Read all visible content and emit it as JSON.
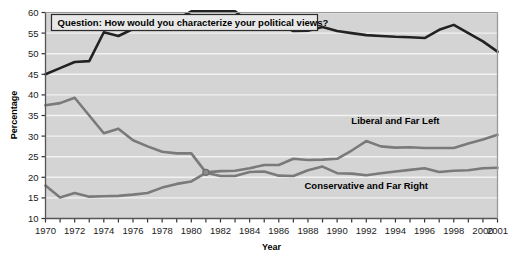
{
  "chart_data": {
    "type": "line",
    "title": "Question: How would you characterize your political views?",
    "xlabel": "Year",
    "ylabel": "Percentage",
    "xlim": [
      1970,
      2001
    ],
    "ylim": [
      10,
      60
    ],
    "ytick_step": 5,
    "grid": "horizontal",
    "legend": "inline-labels",
    "plot_background": "#d4d4d4",
    "x": [
      1970,
      1971,
      1972,
      1973,
      1974,
      1975,
      1976,
      1977,
      1978,
      1979,
      1980,
      1981,
      1982,
      1983,
      1984,
      1985,
      1986,
      1987,
      1988,
      1989,
      1990,
      1991,
      1992,
      1993,
      1994,
      1995,
      1996,
      1997,
      1998,
      1999,
      2000,
      2001
    ],
    "xticks": [
      1970,
      1971,
      1972,
      1973,
      1974,
      1975,
      1976,
      1977,
      1978,
      1979,
      1980,
      1981,
      1982,
      1983,
      1984,
      1985,
      1986,
      1987,
      1988,
      1989,
      1990,
      1991,
      1992,
      1993,
      1994,
      1995,
      1996,
      1997,
      1998,
      1999,
      2000,
      2001
    ],
    "xtick_labels": [
      "1970",
      "",
      "1972",
      "",
      "1974",
      "",
      "1976",
      "",
      "1978",
      "",
      "1980",
      "",
      "1982",
      "",
      "1984",
      "",
      "1986",
      "",
      "1988",
      "",
      "1990",
      "",
      "1992",
      "",
      "1994",
      "",
      "1996",
      "",
      "1998",
      "",
      "2000",
      "2001"
    ],
    "yticks": [
      10,
      15,
      20,
      25,
      30,
      35,
      40,
      45,
      50,
      55,
      60
    ],
    "ytick_labels": [
      "10",
      "15",
      "20",
      "25",
      "30",
      "35",
      "40",
      "45",
      "50",
      "55",
      "60"
    ],
    "series": [
      {
        "name": "Middle of the Road",
        "color": "#222222",
        "width": 2.6,
        "label_x": 1980,
        "label_y": 55.5,
        "values": [
          45.0,
          46.5,
          48.0,
          48.2,
          55.2,
          54.3,
          56.0,
          57.0,
          58.0,
          58.3,
          60.3,
          60.3,
          60.3,
          60.3,
          57.5,
          57.8,
          57.2,
          55.5,
          55.6,
          56.5,
          55.5,
          55.0,
          54.5,
          54.3,
          54.1,
          54.0,
          53.8,
          55.8,
          57.0,
          55.0,
          53.0,
          50.5
        ]
      },
      {
        "name": "Liberal and Far Left",
        "color": "#7a7a7a",
        "width": 2.6,
        "label_x": 1994,
        "label_y": 33.0,
        "values": [
          37.5,
          38.0,
          39.3,
          35.0,
          30.7,
          31.8,
          29.0,
          27.5,
          26.2,
          25.8,
          25.8,
          21.2,
          21.5,
          21.6,
          22.2,
          23.0,
          23.0,
          24.5,
          24.2,
          24.3,
          24.5,
          26.5,
          28.8,
          27.5,
          27.2,
          27.3,
          27.1,
          27.1,
          27.1,
          28.2,
          29.2,
          30.3
        ]
      },
      {
        "name": "Conservative and Far Right",
        "color": "#7a7a7a",
        "width": 2.6,
        "label_x": 1992,
        "label_y": 17.2,
        "values": [
          18.0,
          15.1,
          16.2,
          15.3,
          15.4,
          15.5,
          15.8,
          16.2,
          17.5,
          18.4,
          19.0,
          21.1,
          20.3,
          20.3,
          21.3,
          21.4,
          20.4,
          20.3,
          21.7,
          22.6,
          21.0,
          20.9,
          20.5,
          21.0,
          21.4,
          21.8,
          22.2,
          21.3,
          21.6,
          21.7,
          22.2,
          22.3
        ]
      }
    ],
    "crossover_marker": {
      "x": 1981,
      "y": 21.2
    }
  }
}
